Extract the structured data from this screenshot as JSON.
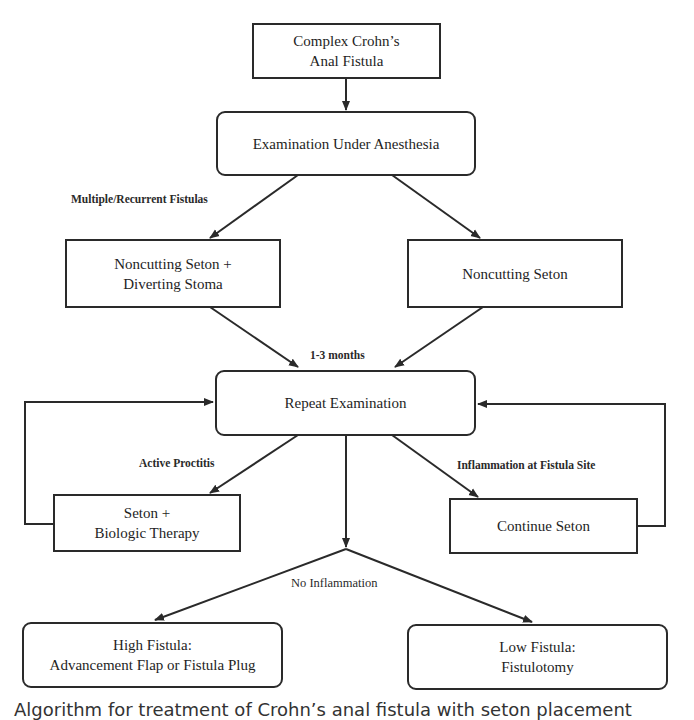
{
  "diagram": {
    "type": "flowchart",
    "nodes": {
      "start": {
        "label": "Complex Crohn’s\nAnal Fistula",
        "shape": "rect"
      },
      "eua": {
        "label": "Examination Under Anesthesia",
        "shape": "rounded"
      },
      "seton_stoma": {
        "label": "Noncutting Seton +\nDiverting Stoma",
        "shape": "rect"
      },
      "seton": {
        "label": "Noncutting Seton",
        "shape": "rect"
      },
      "repeat": {
        "label": "Repeat Examination",
        "shape": "rounded"
      },
      "seton_biologic": {
        "label": "Seton +\nBiologic Therapy",
        "shape": "rect"
      },
      "continue_seton": {
        "label": "Continue Seton",
        "shape": "rect"
      },
      "high_fistula": {
        "label": "High Fistula:\nAdvancement Flap or Fistula Plug",
        "shape": "rounded"
      },
      "low_fistula": {
        "label": "Low Fistula:\nFistulotomy",
        "shape": "rounded"
      }
    },
    "edge_labels": {
      "multiple_recurrent": "Multiple/Recurrent Fistulas",
      "interval": "1-3 months",
      "active_proctitis": "Active Proctitis",
      "inflammation_site": "Inflammation at Fistula Site",
      "no_inflammation": "No Inflammation"
    },
    "edges": [
      {
        "from": "start",
        "to": "eua",
        "label": ""
      },
      {
        "from": "eua",
        "to": "seton_stoma",
        "label": "Multiple/Recurrent Fistulas"
      },
      {
        "from": "eua",
        "to": "seton",
        "label": ""
      },
      {
        "from": "seton_stoma",
        "to": "repeat",
        "label": "1-3 months"
      },
      {
        "from": "seton",
        "to": "repeat",
        "label": "1-3 months"
      },
      {
        "from": "repeat",
        "to": "seton_biologic",
        "label": "Active Proctitis"
      },
      {
        "from": "repeat",
        "to": "continue_seton",
        "label": "Inflammation at Fistula Site"
      },
      {
        "from": "seton_biologic",
        "to": "repeat",
        "label": ""
      },
      {
        "from": "continue_seton",
        "to": "repeat",
        "label": ""
      },
      {
        "from": "repeat",
        "to": "high_fistula",
        "label": "No Inflammation"
      },
      {
        "from": "repeat",
        "to": "low_fistula",
        "label": "No Inflammation"
      }
    ],
    "colors": {
      "line": "#2a2a2a",
      "text": "#1e1e1e",
      "background": "#ffffff"
    }
  },
  "caption": {
    "text": "Algorithm for treatment of Crohn’s anal fistula with seton placement"
  }
}
